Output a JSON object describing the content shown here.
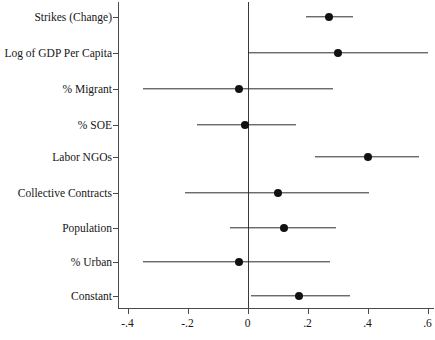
{
  "chart_data": {
    "type": "scatter",
    "title": "",
    "subtitle": "",
    "xlabel": "",
    "ylabel": "",
    "orientation": "horizontal",
    "plot_style": "coefficient-plot",
    "grid": false,
    "legend": null,
    "xlim": [
      -0.5,
      0.62
    ],
    "xticks": [
      -0.4,
      -0.2,
      0,
      0.2,
      0.4,
      0.6
    ],
    "xticklabels": [
      "-.4",
      "-.2",
      "0",
      ".2",
      ".4",
      ".6"
    ],
    "reference_line": 0,
    "categories": [
      "Strikes (Change)",
      "Log of GDP Per Capita",
      "% Migrant",
      "% SOE",
      "Labor NGOs",
      "Collective Contracts",
      "Population",
      "% Urban",
      "Constant"
    ],
    "values": [
      0.27,
      0.3,
      -0.03,
      -0.01,
      0.4,
      0.1,
      0.12,
      -0.03,
      0.17
    ],
    "ci_low": [
      0.195,
      0.0,
      -0.35,
      -0.17,
      0.225,
      -0.21,
      -0.06,
      -0.35,
      0.01
    ],
    "ci_high": [
      0.35,
      0.6,
      0.285,
      0.16,
      0.57,
      0.405,
      0.295,
      0.275,
      0.34
    ],
    "points": [
      {
        "label": "Strikes (Change)",
        "estimate": 0.27,
        "ci_low": 0.195,
        "ci_high": 0.35
      },
      {
        "label": "Log of GDP Per Capita",
        "estimate": 0.3,
        "ci_low": 0.0,
        "ci_high": 0.6
      },
      {
        "label": "% Migrant",
        "estimate": -0.03,
        "ci_low": -0.35,
        "ci_high": 0.285
      },
      {
        "label": "% SOE",
        "estimate": -0.01,
        "ci_low": -0.17,
        "ci_high": 0.16
      },
      {
        "label": "Labor NGOs",
        "estimate": 0.4,
        "ci_low": 0.225,
        "ci_high": 0.57
      },
      {
        "label": "Collective Contracts",
        "estimate": 0.1,
        "ci_low": -0.21,
        "ci_high": 0.405
      },
      {
        "label": "Population",
        "estimate": 0.12,
        "ci_low": -0.06,
        "ci_high": 0.295
      },
      {
        "label": "% Urban",
        "estimate": -0.03,
        "ci_low": -0.35,
        "ci_high": 0.275
      },
      {
        "label": "Constant",
        "estimate": 0.17,
        "ci_low": 0.01,
        "ci_high": 0.34
      }
    ],
    "colors": {
      "marker": "#111111",
      "ci": "#2b2b2b",
      "axis": "#4a4a4a",
      "background": "#ffffff"
    }
  }
}
